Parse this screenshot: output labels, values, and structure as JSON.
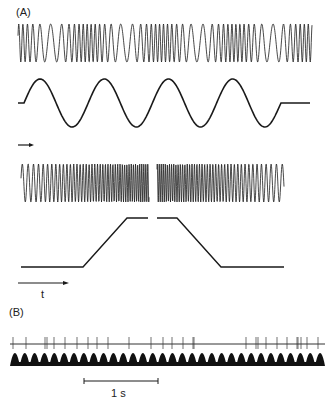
{
  "panels": {
    "a": {
      "label": "(A)",
      "traces": [
        {
          "name": "frequency-modulated-tone",
          "description": "Carrier with periodically varying frequency (4 modulation cycles)"
        },
        {
          "name": "sinusoidal-modulating-waveform",
          "cycles": 4
        },
        {
          "name": "frequency-sweep-tone",
          "description": "Upward then downward frequency sweep with a gap"
        },
        {
          "name": "trapezoid-frequency-envelope",
          "description": "Low flat, rise, high plateau, gap, plateau, fall, low flat"
        }
      ],
      "time_arrow_label": "t"
    },
    "b": {
      "label": "(B)",
      "traces": [
        {
          "name": "spike-train",
          "description": "Extracellular recording with action potentials"
        },
        {
          "name": "stimulus-envelope",
          "peaks": 32
        }
      ],
      "scale_bar_label": "1 s"
    }
  },
  "colors": {
    "ink": "#1a1a1a",
    "background": "#ffffff"
  }
}
